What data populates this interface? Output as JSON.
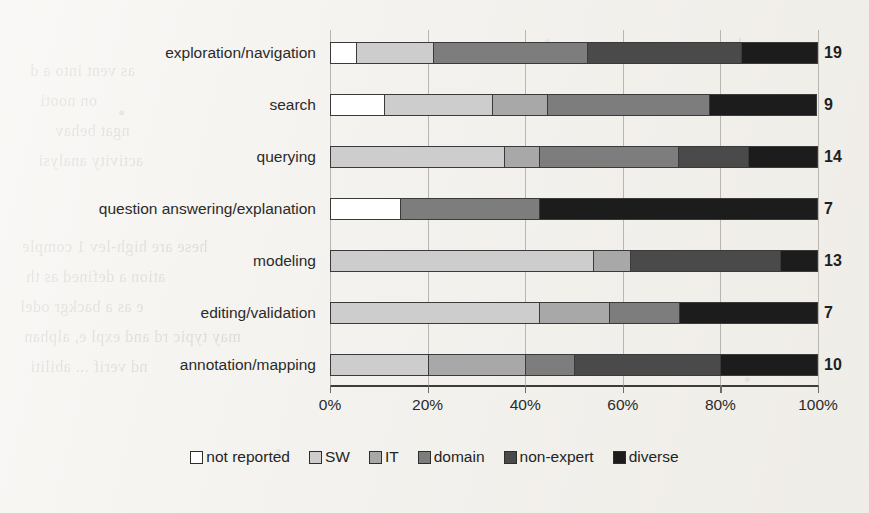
{
  "chart_data": {
    "type": "bar",
    "subtype": "stacked-horizontal-100percent",
    "title": "",
    "xlabel": "",
    "ylabel": "",
    "xlim": [
      0,
      100
    ],
    "xtick_labels": [
      "0%",
      "20%",
      "40%",
      "60%",
      "80%",
      "100%"
    ],
    "xticks": [
      0,
      20,
      40,
      60,
      80,
      100
    ],
    "grid": true,
    "grid_axis": "x",
    "legend_position": "bottom",
    "orientation": "horizontal",
    "categories": [
      "exploration/navigation",
      "search",
      "querying",
      "question answering/explanation",
      "modeling",
      "editing/validation",
      "annotation/mapping"
    ],
    "totals": [
      19,
      9,
      14,
      7,
      13,
      7,
      10
    ],
    "total_labels": [
      "19",
      "9",
      "14",
      "7",
      "13",
      "7",
      "10"
    ],
    "series": [
      {
        "name": "not reported",
        "color": "#ffffff",
        "values": [
          5.3,
          11.1,
          0.0,
          14.3,
          0.0,
          0.0,
          0.0
        ]
      },
      {
        "name": "SW",
        "color": "#cdcdcd",
        "values": [
          15.8,
          22.2,
          35.7,
          0.0,
          53.8,
          42.9,
          20.0
        ]
      },
      {
        "name": "IT",
        "color": "#a8a8a8",
        "values": [
          0.0,
          11.1,
          7.1,
          0.0,
          7.7,
          14.3,
          20.0
        ]
      },
      {
        "name": "domain",
        "color": "#7d7d7d",
        "values": [
          31.6,
          33.3,
          28.6,
          28.6,
          0.0,
          14.3,
          10.0
        ]
      },
      {
        "name": "non-expert",
        "color": "#4a4a4a",
        "values": [
          31.6,
          0.0,
          14.3,
          0.0,
          30.8,
          0.0,
          30.0
        ]
      },
      {
        "name": "diverse",
        "color": "#1c1c1c",
        "values": [
          15.8,
          22.2,
          14.3,
          57.1,
          7.7,
          28.6,
          20.0
        ]
      }
    ]
  },
  "legend": {
    "items": [
      {
        "label": "not reported",
        "color": "#ffffff"
      },
      {
        "label": "SW",
        "color": "#cdcdcd"
      },
      {
        "label": "IT",
        "color": "#a8a8a8"
      },
      {
        "label": "domain",
        "color": "#7d7d7d"
      },
      {
        "label": "non-expert",
        "color": "#4a4a4a"
      },
      {
        "label": "diverse",
        "color": "#1c1c1c"
      }
    ]
  },
  "scan_artifacts": {
    "bleed_lines": [
      "so be na",
      "as vent into a d",
      "on nooti",
      "ngat behav",
      "activity analysi",
      "hese are high-lev 1 comple",
      "ation a  defined as th",
      "e as a  backgr  odel",
      "may typic  rd and expl  e, alphan",
      "nd verif  ... abiliti"
    ]
  }
}
